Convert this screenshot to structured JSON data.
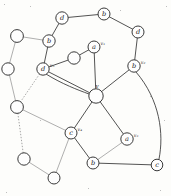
{
  "figure": {
    "background": "#fdfdfb",
    "edge_color": "#3f3f3f",
    "faint_edge_color": "#9a9a9a",
    "node_fill": "#fefefe",
    "node_stroke": "#3a3a3a"
  },
  "hub": {
    "name": "center-vertex",
    "label": "v",
    "cx": 96,
    "cy": 96,
    "r": 7.2
  },
  "nodes": [
    {
      "id": "n-top-d",
      "label": "d",
      "sub": "",
      "cx": 62,
      "cy": 18,
      "r": 6.2,
      "labeled": true
    },
    {
      "id": "n-top-b",
      "label": "b",
      "sub": "",
      "cx": 104,
      "cy": 14,
      "r": 6.0,
      "labeled": true
    },
    {
      "id": "n-right-d",
      "label": "d",
      "sub": "",
      "cx": 138,
      "cy": 32,
      "r": 6.0,
      "labeled": true
    },
    {
      "id": "n-left-b",
      "label": "b",
      "sub": "",
      "cx": 49,
      "cy": 41,
      "r": 6.2,
      "labeled": true
    },
    {
      "id": "n-v1",
      "label": "a",
      "sub": "v₁",
      "cx": 94,
      "cy": 47,
      "r": 6.0,
      "labeled": true
    },
    {
      "id": "n-v2",
      "label": "b",
      "sub": "v₂",
      "cx": 134,
      "cy": 66,
      "r": 6.2,
      "labeled": true
    },
    {
      "id": "n-v5",
      "label": "d",
      "sub": "v₅",
      "cx": 43,
      "cy": 69,
      "r": 6.2,
      "labeled": true
    },
    {
      "id": "n-v4",
      "label": "c",
      "sub": "v₄",
      "cx": 71,
      "cy": 133,
      "r": 6.0,
      "labeled": true
    },
    {
      "id": "n-v3",
      "label": "a",
      "sub": "v₃",
      "cx": 127,
      "cy": 139,
      "r": 6.2,
      "labeled": true
    },
    {
      "id": "n-bot-b",
      "label": "b",
      "sub": "",
      "cx": 93,
      "cy": 163,
      "r": 6.0,
      "labeled": true
    },
    {
      "id": "n-bot-c",
      "label": "c",
      "sub": "",
      "cx": 157,
      "cy": 165,
      "r": 5.8,
      "labeled": true
    },
    {
      "id": "n-empty-1",
      "label": "",
      "sub": "",
      "cx": 17,
      "cy": 36,
      "r": 6.4,
      "labeled": false
    },
    {
      "id": "n-empty-2",
      "label": "",
      "sub": "",
      "cx": 8,
      "cy": 69,
      "r": 6.2,
      "labeled": false
    },
    {
      "id": "n-empty-3",
      "label": "",
      "sub": "",
      "cx": 17,
      "cy": 107,
      "r": 6.4,
      "labeled": false
    },
    {
      "id": "n-empty-4",
      "label": "",
      "sub": "",
      "cx": 24,
      "cy": 159,
      "r": 6.2,
      "labeled": false
    },
    {
      "id": "n-empty-5",
      "label": "",
      "sub": "",
      "cx": 54,
      "cy": 178,
      "r": 6.0,
      "labeled": false
    },
    {
      "id": "n-empty-6",
      "label": "",
      "sub": "",
      "cx": 74,
      "cy": 58,
      "r": 6.2,
      "labeled": false
    }
  ],
  "edges": [
    {
      "from": "n-top-d",
      "to": "n-top-b",
      "style": "solid"
    },
    {
      "from": "n-top-b",
      "to": "n-right-d",
      "style": "solid"
    },
    {
      "from": "n-top-d",
      "to": "n-left-b",
      "style": "solid"
    },
    {
      "from": "n-right-d",
      "to": "n-v2",
      "style": "solid"
    },
    {
      "from": "n-left-b",
      "to": "n-v5",
      "style": "solid"
    },
    {
      "from": "n-left-b",
      "to": "n-empty-1",
      "style": "faint"
    },
    {
      "from": "n-v5",
      "to": "n-empty-6",
      "style": "solid"
    },
    {
      "from": "n-empty-6",
      "to": "n-v1",
      "style": "solid"
    },
    {
      "from": "n-v1",
      "to": "hub",
      "style": "solid"
    },
    {
      "from": "n-v2",
      "to": "hub",
      "style": "solid"
    },
    {
      "from": "n-v5",
      "to": "hub",
      "style": "solid"
    },
    {
      "from": "n-v4",
      "to": "hub",
      "style": "solid"
    },
    {
      "from": "n-v3",
      "to": "hub",
      "style": "solid"
    },
    {
      "from": "n-v4",
      "to": "n-bot-b",
      "style": "solid"
    },
    {
      "from": "n-bot-b",
      "to": "n-v3",
      "style": "faint"
    },
    {
      "from": "n-bot-b",
      "to": "n-bot-c",
      "style": "solid"
    },
    {
      "from": "n-empty-1",
      "to": "n-empty-2",
      "style": "faint"
    },
    {
      "from": "n-empty-2",
      "to": "n-empty-3",
      "style": "faint"
    },
    {
      "from": "n-empty-3",
      "to": "n-empty-4",
      "style": "dotted"
    },
    {
      "from": "n-empty-4",
      "to": "n-empty-5",
      "style": "faint"
    },
    {
      "from": "n-empty-3",
      "to": "n-v4",
      "style": "faint"
    },
    {
      "from": "n-empty-5",
      "to": "n-v4",
      "style": "faint"
    },
    {
      "from": "n-v5",
      "to": "n-empty-3",
      "style": "dotted"
    }
  ],
  "curved_edges": [
    {
      "id": "curve-v2-c",
      "d": "M 136 72 C 160 100, 164 134, 159 159",
      "style": "solid"
    },
    {
      "id": "curve-v5-hub-left",
      "d": "M 46 74 C 62 84, 78 90, 89 94",
      "style": "solid"
    }
  ]
}
